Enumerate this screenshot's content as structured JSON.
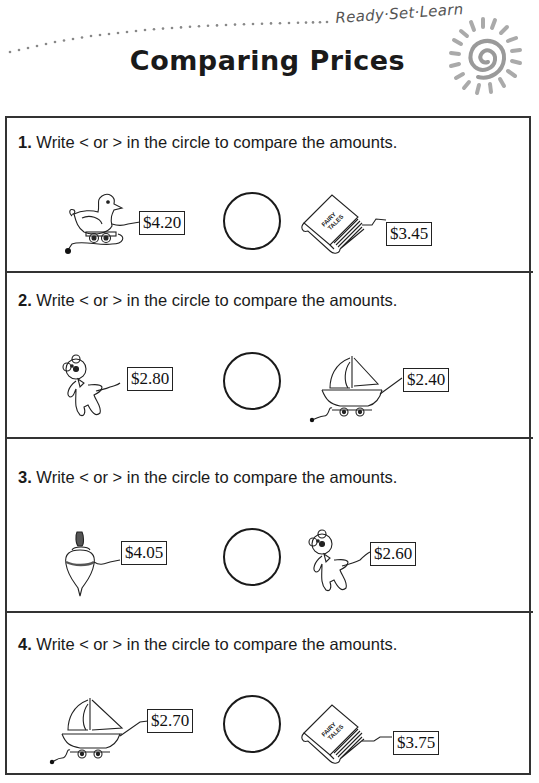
{
  "header": {
    "brand": "Ready·Set·Learn",
    "title": "Comparing Prices",
    "logo_icon": "sun-spiral-icon"
  },
  "problems": [
    {
      "number": "1.",
      "instruction": "Write < or > in the circle to compare the amounts.",
      "left": {
        "item": "toy-duck",
        "icon": "pull-toy-duck-icon",
        "price": "$4.20"
      },
      "right": {
        "item": "fairy-tales-book",
        "icon": "book-icon",
        "price": "$3.45",
        "book_title": [
          "FAIRY",
          "TALES"
        ]
      },
      "answer": ""
    },
    {
      "number": "2.",
      "instruction": "Write < or > in the circle to compare the amounts.",
      "left": {
        "item": "teddy-bear",
        "icon": "teddy-bear-icon",
        "price": "$2.80"
      },
      "right": {
        "item": "toy-boat",
        "icon": "pull-toy-boat-icon",
        "price": "$2.40"
      },
      "answer": ""
    },
    {
      "number": "3.",
      "instruction": "Write < or > in the circle to compare the amounts.",
      "left": {
        "item": "spinning-top",
        "icon": "spinning-top-icon",
        "price": "$4.05"
      },
      "right": {
        "item": "teddy-bear",
        "icon": "teddy-bear-icon",
        "price": "$2.60"
      },
      "answer": ""
    },
    {
      "number": "4.",
      "instruction": "Write < or > in the circle to compare the amounts.",
      "left": {
        "item": "toy-boat",
        "icon": "pull-toy-boat-icon",
        "price": "$2.70"
      },
      "right": {
        "item": "fairy-tales-book",
        "icon": "book-icon",
        "price": "$3.75",
        "book_title": [
          "FAIRY",
          "TALES"
        ]
      },
      "answer": ""
    }
  ]
}
